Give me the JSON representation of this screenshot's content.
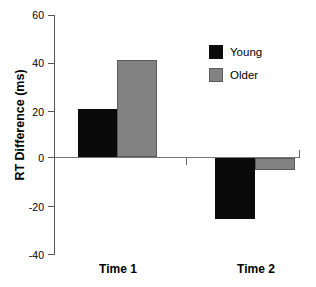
{
  "chart_data": {
    "type": "bar",
    "title": "",
    "xlabel": "",
    "ylabel": "RT Difference (ms)",
    "categories": [
      "Time 1",
      "Time 2"
    ],
    "series": [
      {
        "name": "Young",
        "values": [
          20,
          -25
        ],
        "color": "#0a0a0a"
      },
      {
        "name": "Older",
        "values": [
          40,
          -5
        ],
        "color": "#828282"
      }
    ],
    "ylim": [
      -40,
      60
    ],
    "yticks": [
      60,
      40,
      20,
      0,
      -20,
      -40
    ],
    "ytick_labels": [
      "60",
      "40",
      "20",
      "0",
      "-20",
      "-40"
    ],
    "grid": false,
    "legend_position": "top-right",
    "zero_line": true
  },
  "axes": {
    "ylabel": "RT Difference (ms)",
    "ticks": [
      {
        "value": 60,
        "label": "60"
      },
      {
        "value": 40,
        "label": "40"
      },
      {
        "value": 20,
        "label": "20"
      },
      {
        "value": 0,
        "label": "0"
      },
      {
        "value": -20,
        "label": "-20"
      },
      {
        "value": -40,
        "label": "-40"
      }
    ],
    "categories": [
      {
        "label": "Time 1"
      },
      {
        "label": "Time 2"
      }
    ]
  },
  "legend": {
    "entries": [
      {
        "label": "Young",
        "color": "#0a0a0a"
      },
      {
        "label": "Older",
        "color": "#828282"
      }
    ]
  }
}
